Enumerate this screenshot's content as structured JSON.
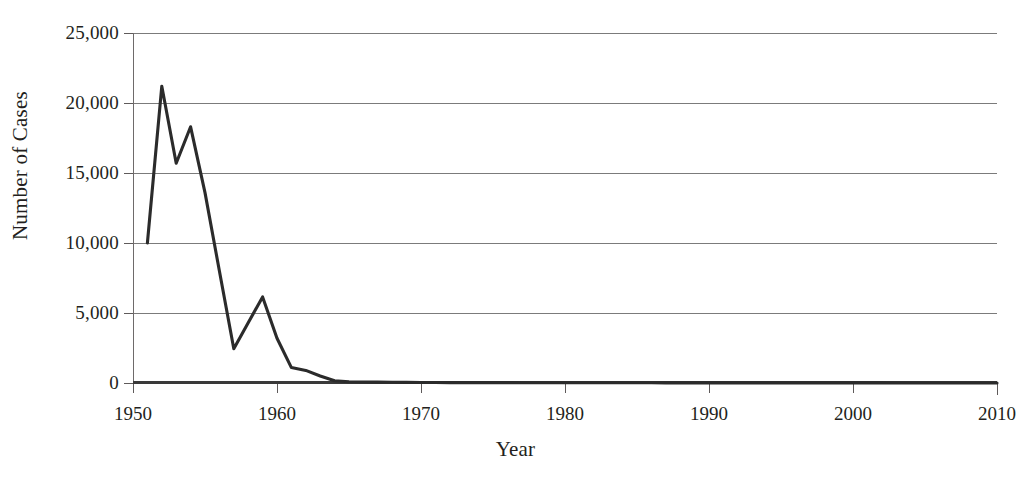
{
  "chart_data": {
    "type": "line",
    "title": "",
    "xlabel": "Year",
    "ylabel": "Number of Cases",
    "xlim": [
      1950,
      2010
    ],
    "ylim": [
      0,
      25000
    ],
    "grid": true,
    "legend": false,
    "x_ticks": [
      "1950",
      "1960",
      "1970",
      "1980",
      "1990",
      "2000",
      "2010"
    ],
    "x_tick_values": [
      1950,
      1960,
      1970,
      1980,
      1990,
      2000,
      2010
    ],
    "y_ticks": [
      "0",
      "5,000",
      "10,000",
      "15,000",
      "20,000",
      "25,000"
    ],
    "y_tick_values": [
      0,
      5000,
      10000,
      15000,
      20000,
      25000
    ],
    "series": [
      {
        "name": "Number of Cases",
        "color": "#2b2b2b",
        "x": [
          1951,
          1952,
          1953,
          1954,
          1955,
          1956,
          1957,
          1958,
          1959,
          1960,
          1961,
          1962,
          1963,
          1964,
          1965,
          1966,
          1967,
          1968,
          1969,
          1970,
          1971,
          1972,
          1973,
          1974,
          1975,
          1976,
          1977,
          1978,
          1979,
          1980,
          1981,
          1982,
          1983,
          1984,
          1985,
          1986,
          1987,
          1988,
          1989,
          1990,
          1991,
          1992,
          1993,
          1994,
          1995,
          1996,
          1997,
          1998,
          1999,
          2000,
          2001,
          2002,
          2003,
          2004,
          2005,
          2006,
          2007,
          2008,
          2009,
          2010
        ],
        "values": [
          10000,
          21200,
          15700,
          18300,
          13600,
          8000,
          2450,
          4300,
          6150,
          3200,
          1100,
          900,
          500,
          160,
          90,
          70,
          60,
          50,
          45,
          40,
          35,
          30,
          30,
          25,
          25,
          25,
          20,
          20,
          20,
          20,
          15,
          15,
          15,
          15,
          15,
          15,
          10,
          10,
          10,
          10,
          10,
          10,
          10,
          10,
          10,
          10,
          8,
          8,
          8,
          8,
          8,
          8,
          5,
          5,
          5,
          5,
          5,
          5,
          5,
          5
        ]
      }
    ]
  },
  "axes": {
    "y_title": "Number of Cases",
    "x_title": "Year"
  }
}
